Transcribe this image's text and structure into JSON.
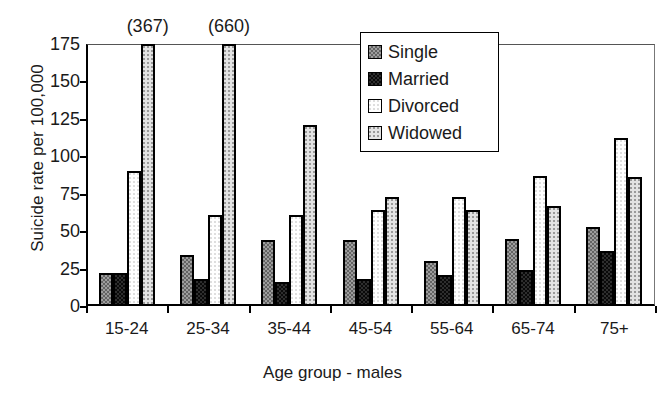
{
  "chart_data": {
    "type": "bar",
    "title": "",
    "xlabel": "Age group - males",
    "ylabel": "Suicide rate per 100,000",
    "categories": [
      "15-24",
      "25-34",
      "35-44",
      "45-54",
      "55-64",
      "65-74",
      "75+"
    ],
    "ylim": [
      0,
      175
    ],
    "yticks": [
      0,
      25,
      50,
      75,
      100,
      125,
      150,
      175
    ],
    "grid": false,
    "legend_position": "upper-right-inside",
    "series": [
      {
        "name": "Single",
        "values": [
          22,
          34,
          44,
          44,
          30,
          45,
          53
        ]
      },
      {
        "name": "Married",
        "values": [
          22,
          18,
          16,
          18,
          21,
          24,
          37
        ]
      },
      {
        "name": "Divorced",
        "values": [
          90,
          61,
          61,
          64,
          73,
          87,
          112
        ]
      },
      {
        "name": "Widowed",
        "values": [
          367,
          660,
          121,
          73,
          64,
          67,
          86
        ]
      }
    ],
    "annotations": [
      {
        "text": "(367)",
        "category": "15-24",
        "series": "Widowed",
        "note": "bar clipped at axis maximum"
      },
      {
        "text": "(660)",
        "category": "25-34",
        "series": "Widowed",
        "note": "bar clipped at axis maximum"
      }
    ]
  },
  "legend": {
    "items": [
      {
        "label": "Single",
        "swatch": "pat-single"
      },
      {
        "label": "Married",
        "swatch": "pat-married"
      },
      {
        "label": "Divorced",
        "swatch": "pat-divorced"
      },
      {
        "label": "Widowed",
        "swatch": "pat-widowed"
      }
    ]
  }
}
